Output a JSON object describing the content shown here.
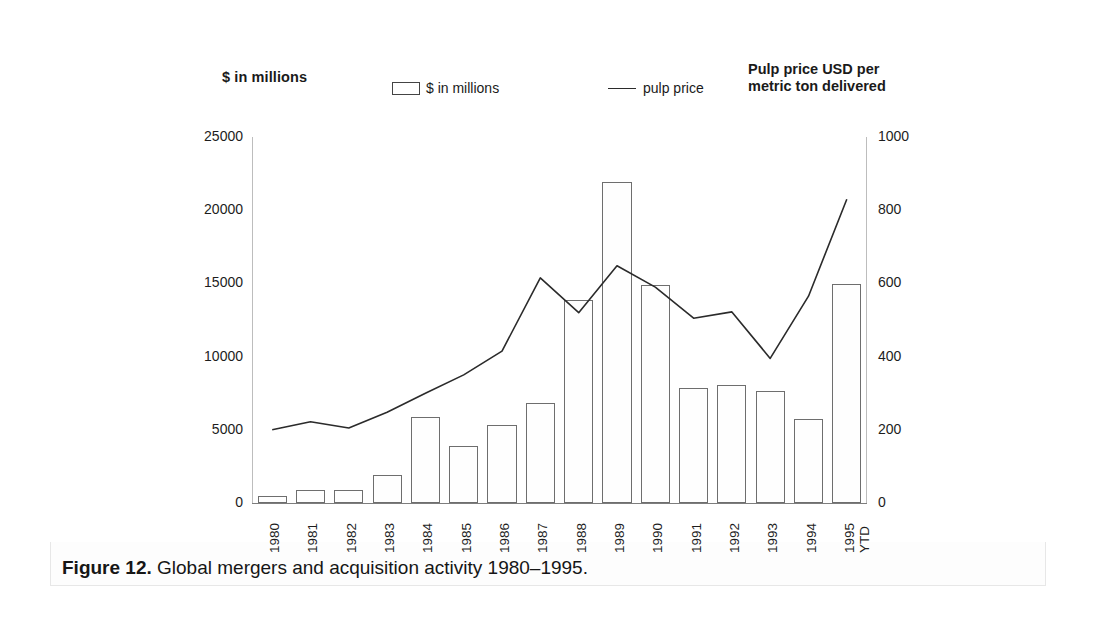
{
  "figure": {
    "caption_label": "Figure 12.",
    "caption_text": "Global mergers and acquisition activity 1980–1995."
  },
  "header": {
    "left_axis_title": "$ in millions",
    "right_axis_title": "Pulp price USD per\nmetric ton delivered"
  },
  "legend": {
    "bar_label": "$ in millions",
    "line_label": "pulp price"
  },
  "axes": {
    "left_ticks": [
      "0",
      "5000",
      "10000",
      "15000",
      "20000",
      "25000"
    ],
    "right_ticks": [
      "0",
      "200",
      "400",
      "600",
      "800",
      "1000"
    ]
  },
  "chart_data": {
    "type": "bar",
    "xlabel": "",
    "ylabel": "$ in millions",
    "y2label": "Pulp price USD per metric ton delivered",
    "grid": false,
    "legend_position": "top",
    "ylim": [
      0,
      25000
    ],
    "y2lim": [
      0,
      1000
    ],
    "categories": [
      "1980",
      "1981",
      "1982",
      "1983",
      "1984",
      "1985",
      "1986",
      "1987",
      "1988",
      "1989",
      "1990",
      "1991",
      "1992",
      "1993",
      "1994",
      "1995 YTD"
    ],
    "category_lines": [
      [
        "1980",
        ""
      ],
      [
        "1981",
        ""
      ],
      [
        "1982",
        ""
      ],
      [
        "1983",
        ""
      ],
      [
        "1984",
        ""
      ],
      [
        "1985",
        ""
      ],
      [
        "1986",
        ""
      ],
      [
        "1987",
        ""
      ],
      [
        "1988",
        ""
      ],
      [
        "1989",
        ""
      ],
      [
        "1990",
        ""
      ],
      [
        "1991",
        ""
      ],
      [
        "1992",
        ""
      ],
      [
        "1993",
        ""
      ],
      [
        "1994",
        ""
      ],
      [
        "1995",
        "YTD"
      ]
    ],
    "series": [
      {
        "name": "$ in millions",
        "kind": "bar",
        "axis": "left",
        "values": [
          500,
          900,
          900,
          1900,
          5900,
          3900,
          5350,
          6850,
          13900,
          21900,
          14900,
          7850,
          8050,
          7650,
          5750,
          14950
        ]
      },
      {
        "name": "pulp price",
        "kind": "line",
        "axis": "right",
        "values": [
          200,
          222,
          205,
          248,
          300,
          350,
          415,
          615,
          520,
          648,
          590,
          505,
          522,
          395,
          565,
          830
        ]
      }
    ]
  },
  "style": {
    "bar_stroke": "#6e6e6e",
    "bar_fill": "#fefefe",
    "line_color": "#2b2b2b",
    "text_color": "#1a1a1a",
    "page_background": "#ffffff",
    "plate_background": "#ffffff"
  }
}
